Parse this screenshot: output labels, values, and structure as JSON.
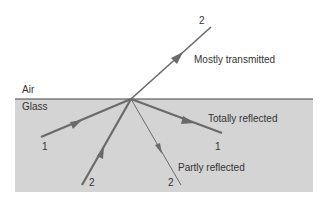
{
  "media": {
    "air": "Air",
    "glass": "Glass"
  },
  "rays": {
    "ray1_in": "1",
    "ray1_out": "1",
    "ray2_in": "2",
    "ray2_reflected": "2",
    "ray2_transmitted": "2"
  },
  "annotations": {
    "mostly_transmitted": "Mostly transmitted",
    "totally_reflected": "Totally reflected",
    "partly_reflected": "Partly reflected"
  },
  "colors": {
    "glass": "#d4d4d4",
    "ray": "#6a6a6a",
    "interface": "#444444"
  }
}
